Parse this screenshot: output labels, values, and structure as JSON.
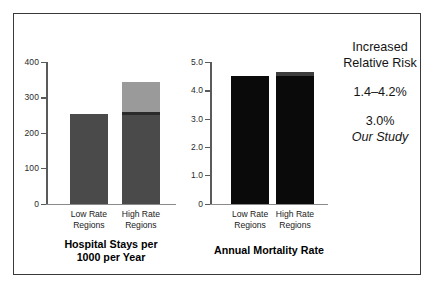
{
  "figure": {
    "background": "#ffffff",
    "frame_color": "#3a3a3a"
  },
  "annotations": {
    "heading_line1": "Increased",
    "heading_line2": "Relative Risk",
    "range_value": "1.4–4.2%",
    "study_value": "3.0%",
    "study_label": "Our Study"
  },
  "chart_data": [
    {
      "type": "bar",
      "id": "hospital-stays",
      "title": "Hospital Stays per 1000 per Year",
      "title_line1": "Hospital Stays per",
      "title_line2": "1000 per Year",
      "xlabel": "",
      "ylabel": "",
      "ylim": [
        0,
        400
      ],
      "yticks": [
        0,
        100,
        200,
        300,
        400
      ],
      "ytick_labels": [
        "0",
        "100",
        "200",
        "300",
        "400"
      ],
      "grid": false,
      "legend": "none",
      "categories": [
        "Low Rate Regions",
        "High Rate Regions"
      ],
      "category_lines": [
        [
          "Low Rate",
          "Regions"
        ],
        [
          "High Rate",
          "Regions"
        ]
      ],
      "stacked": true,
      "series": [
        {
          "name": "Base hospital stays",
          "color": "#4a4a4a",
          "values": [
            252,
            250
          ]
        },
        {
          "name": "Dark band",
          "color": "#2b2b2b",
          "values": [
            0,
            8
          ]
        },
        {
          "name": "Excess stays",
          "color": "#9a9a9a",
          "values": [
            0,
            85
          ]
        }
      ],
      "totals": [
        252,
        343
      ]
    },
    {
      "type": "bar",
      "id": "annual-mortality",
      "title": "Annual Mortality Rate",
      "title_line1": "Annual Mortality Rate",
      "title_line2": "",
      "xlabel": "",
      "ylabel": "",
      "ylim": [
        0,
        5.0
      ],
      "yticks": [
        0,
        1.0,
        2.0,
        3.0,
        4.0,
        5.0
      ],
      "ytick_labels": [
        "0",
        "1.0",
        "2.0",
        "3.0",
        "4.0",
        "5.0"
      ],
      "grid": false,
      "legend": "none",
      "categories": [
        "Low Rate Regions",
        "High Rate Regions"
      ],
      "category_lines": [
        [
          "Low Rate",
          "Regions"
        ],
        [
          "High Rate",
          "Regions"
        ]
      ],
      "stacked": true,
      "series": [
        {
          "name": "Base mortality",
          "color": "#0a0a0a",
          "values": [
            4.51,
            4.52
          ]
        },
        {
          "name": "Excess mortality",
          "color": "#3d3d3d",
          "values": [
            0,
            0.13
          ]
        }
      ],
      "totals": [
        4.51,
        4.65
      ]
    }
  ]
}
